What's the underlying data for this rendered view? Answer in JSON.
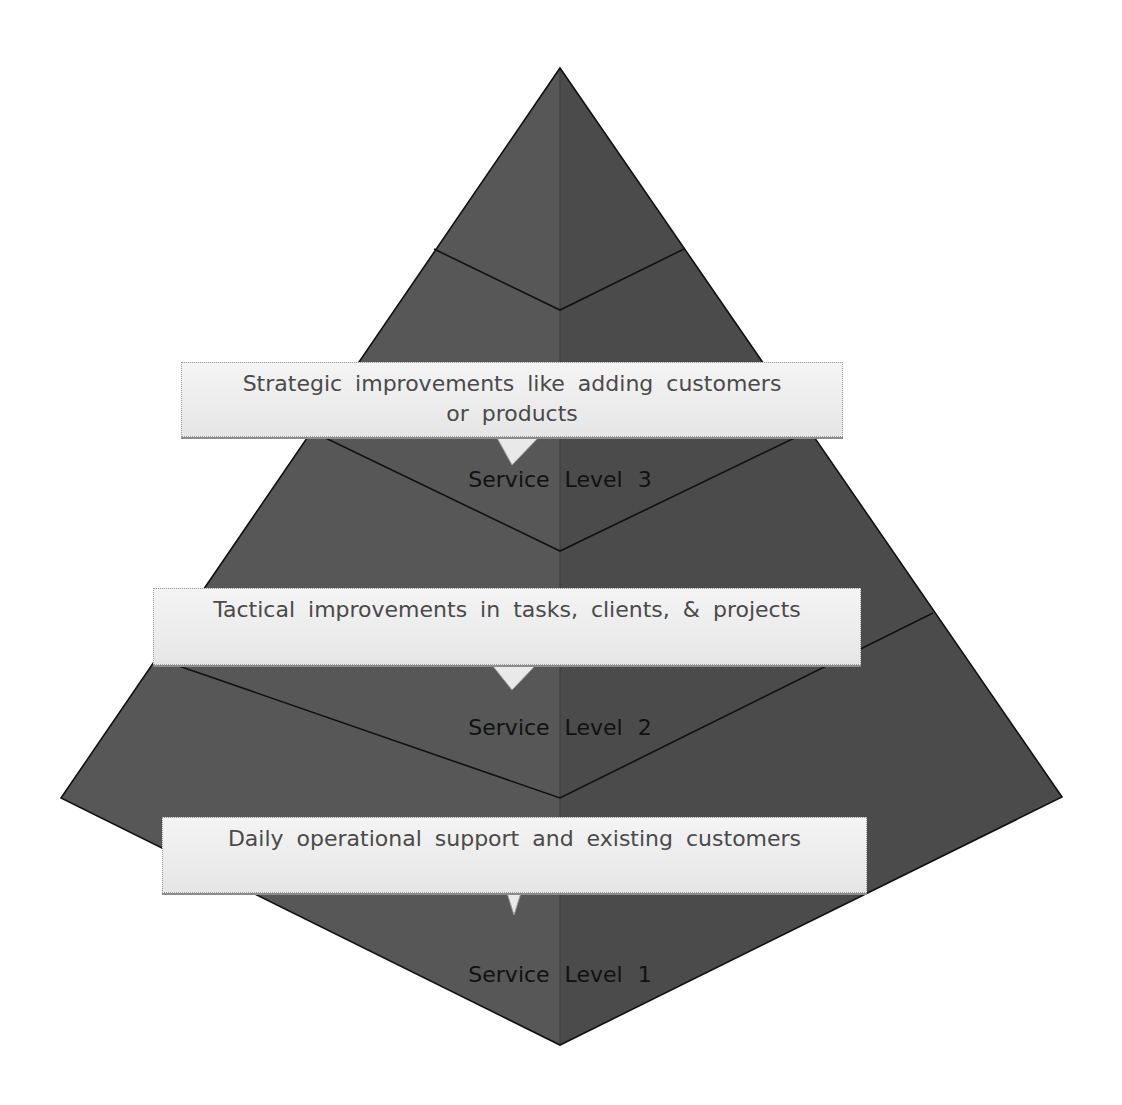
{
  "diagram": {
    "type": "pyramid",
    "colors": {
      "face_left": "#555555",
      "face_right": "#4a4a4a",
      "divider": "#111111",
      "callout_bg": "#efefef",
      "callout_text": "#4a4a4a",
      "label_text": "#111111"
    },
    "levels": [
      {
        "label": "Service Level 3",
        "callout": "Strategic improvements like adding customers or products"
      },
      {
        "label": "Service Level 2",
        "callout": "Tactical improvements in tasks, clients, & projects"
      },
      {
        "label": "Service Level 1",
        "callout": "Daily operational support and existing customers"
      }
    ]
  }
}
